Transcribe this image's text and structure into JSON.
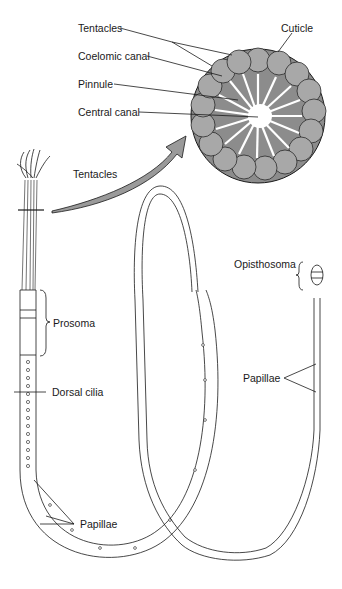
{
  "figure": {
    "colors": {
      "ink": "#1a1a1a",
      "cross_section_fill": "#8c8c8c",
      "cell_fill": "#a8a8a8",
      "arrow_fill": "#9a9a9a",
      "background": "#ffffff"
    }
  },
  "labels": {
    "cross_section": {
      "tentacles": "Tentacles",
      "coelomic_canal": "Coelomic canal",
      "pinnule": "Pinnule",
      "central_canal": "Central canal",
      "cuticle": "Cuticle"
    },
    "body": {
      "tentacles": "Tentacles",
      "prosoma": "Prosoma",
      "dorsal_cilia": "Dorsal cilia",
      "papillae_left": "Papillae",
      "opisthosoma": "Opisthosoma",
      "papillae_right": "Papillae"
    }
  }
}
